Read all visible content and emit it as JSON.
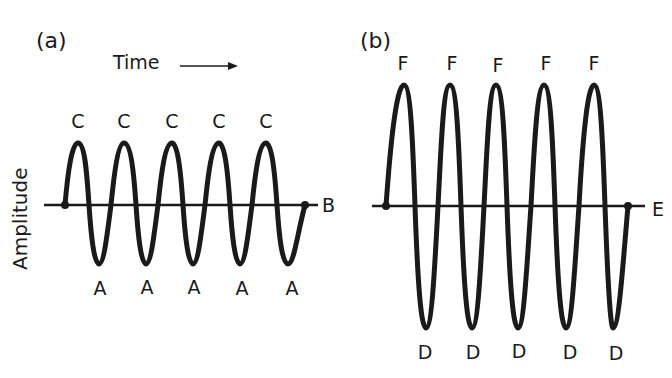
{
  "figure": {
    "panel_a": {
      "tag": "(a)",
      "time_label": "Time",
      "y_axis_label": "Amplitude",
      "axis_end_label": "B",
      "peak_labels": [
        "C",
        "C",
        "C",
        "C",
        "C"
      ],
      "trough_labels": [
        "A",
        "A",
        "A",
        "A",
        "A"
      ],
      "cycles": 5,
      "relative_amplitude": "small"
    },
    "panel_b": {
      "tag": "(b)",
      "axis_end_label": "E",
      "peak_labels": [
        "F",
        "F",
        "F",
        "F",
        "F"
      ],
      "trough_labels": [
        "D",
        "D",
        "D",
        "D",
        "D"
      ],
      "cycles": 5,
      "relative_amplitude": "large"
    },
    "colors": {
      "ink": "#1a1a1a",
      "background": "#ffffff"
    }
  }
}
